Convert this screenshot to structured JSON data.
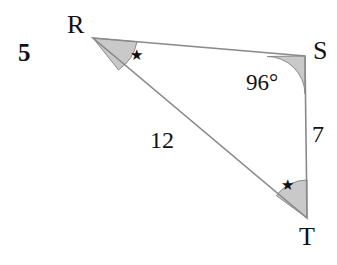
{
  "figure": {
    "problem_number": "5",
    "shape": "triangle",
    "stroke_color": "#8a8a8a",
    "angle_fill_color": "#c9c9c9",
    "angle_stroke_color": "#8a8a8a",
    "text_color": "#111111",
    "background_color": "#ffffff"
  },
  "vertices": [
    {
      "name": "R",
      "label": "R",
      "x": 93,
      "y": 38
    },
    {
      "name": "S",
      "label": "S",
      "x": 305,
      "y": 56
    },
    {
      "name": "T",
      "label": "T",
      "x": 307,
      "y": 218
    }
  ],
  "sides": [
    {
      "name": "RS",
      "from": "R",
      "to": "S",
      "label": ""
    },
    {
      "name": "RT",
      "from": "R",
      "to": "T",
      "label": "12"
    },
    {
      "name": "ST",
      "from": "S",
      "to": "T",
      "label": "7"
    }
  ],
  "angles": [
    {
      "at": "R",
      "label": "★",
      "type": "star-mark",
      "measure": ""
    },
    {
      "at": "S",
      "label": "96°",
      "type": "measure",
      "measure": "96"
    },
    {
      "at": "T",
      "label": "★",
      "type": "star-mark",
      "measure": ""
    }
  ],
  "labels": {
    "vertex_r": "R",
    "vertex_s": "S",
    "vertex_t": "T",
    "angle_s": "96°",
    "side_rt": "12",
    "side_st": "7",
    "star_r": "★",
    "star_t": "★"
  }
}
